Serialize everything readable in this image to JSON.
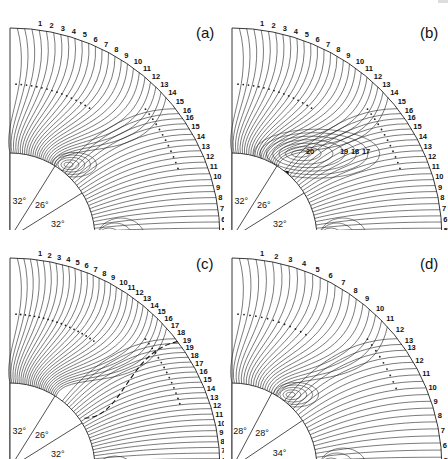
{
  "figure": {
    "panels": [
      {
        "id": "a",
        "label": "(a)",
        "origin": [
          10,
          238
        ],
        "outer_radius": 210,
        "inner_radius": 85,
        "sector_angles": [
          "32°",
          "26°",
          "32°"
        ],
        "top_labels": [
          "1",
          "2",
          "3",
          "4",
          "5",
          "6",
          "7",
          "8",
          "9",
          "10",
          "11",
          "12",
          "13",
          "14",
          "15",
          "16"
        ],
        "right_labels": [
          "16",
          "15",
          "14",
          "13",
          "12",
          "11",
          "10",
          "9",
          "8",
          "7",
          "6",
          "5"
        ],
        "inner_labels": [],
        "vortex": {
          "present": true,
          "size": "small"
        },
        "dashed_separatrix": false
      },
      {
        "id": "b",
        "label": "(b)",
        "origin": [
          232,
          238
        ],
        "outer_radius": 210,
        "inner_radius": 85,
        "sector_angles": [
          "32°",
          "26°",
          "32°"
        ],
        "top_labels": [
          "1",
          "2",
          "3",
          "4",
          "5",
          "6",
          "7",
          "8",
          "9",
          "10",
          "11",
          "12",
          "13",
          "14",
          "15",
          "16"
        ],
        "right_labels": [
          "16",
          "15",
          "14",
          "13",
          "12",
          "11",
          "10",
          "9",
          "8",
          "7",
          "6",
          "5"
        ],
        "inner_labels": [
          "20",
          "19",
          "18",
          "17"
        ],
        "vortex": {
          "present": true,
          "size": "large"
        },
        "dashed_separatrix": false
      },
      {
        "id": "c",
        "label": "(c)",
        "origin": [
          10,
          468
        ],
        "outer_radius": 210,
        "inner_radius": 85,
        "sector_angles": [
          "32°",
          "26°",
          "32°"
        ],
        "top_labels": [
          "1",
          "2",
          "3",
          "4",
          "5",
          "6",
          "7",
          "8",
          "9",
          "10",
          "11",
          "12",
          "13",
          "14",
          "15",
          "16",
          "17",
          "18",
          "19"
        ],
        "right_labels": [
          "19",
          "18",
          "17",
          "16",
          "15",
          "14",
          "13",
          "12",
          "11",
          "10",
          "9",
          "8",
          "7",
          "6"
        ],
        "inner_labels": [],
        "vortex": {
          "present": false,
          "size": "none"
        },
        "dashed_separatrix": true
      },
      {
        "id": "d",
        "label": "(d)",
        "origin": [
          232,
          468
        ],
        "outer_radius": 210,
        "inner_radius": 85,
        "sector_angles": [
          "28°",
          "28°",
          "34°"
        ],
        "top_labels": [
          "1",
          "2",
          "3",
          "4",
          "5",
          "6",
          "7",
          "8",
          "9",
          "10",
          "11",
          "12",
          "13"
        ],
        "right_labels": [
          "13",
          "12",
          "11",
          "10",
          "9",
          "8",
          "7",
          "6",
          "5"
        ],
        "inner_labels": [],
        "vortex": {
          "present": true,
          "size": "small"
        },
        "dashed_separatrix": false
      }
    ]
  }
}
